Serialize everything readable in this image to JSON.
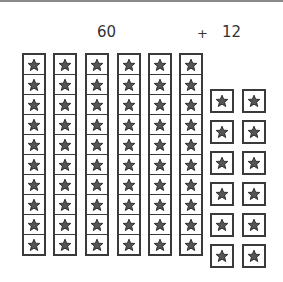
{
  "labels": {
    "tens": "60",
    "operator": "+",
    "ones": "12"
  },
  "tens_columns": {
    "count": 6,
    "cells_per_column": 10,
    "x_positions": [
      22,
      53,
      85,
      117,
      148,
      179
    ]
  },
  "ones_boxes": {
    "count": 12,
    "columns_x": [
      210,
      242
    ],
    "rows_y": [
      89,
      120,
      151,
      182,
      213,
      244
    ]
  },
  "icon": "star-icon",
  "colors": {
    "stroke": "#3a3a3a",
    "star_fill": "#555555",
    "background": "#ffffff"
  }
}
